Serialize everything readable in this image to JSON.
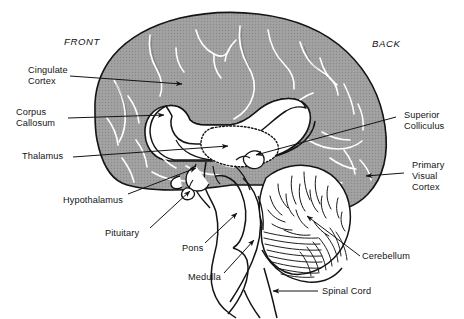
{
  "figure": {
    "background_color": "#ffffff",
    "ink_color": "#141414",
    "cortex_fill_color": "#9a9a9a",
    "sulcus_line_color": "#ffffff",
    "interior_fill_color": "#ffffff"
  },
  "orientation": {
    "front": "FRONT",
    "back": "BACK"
  },
  "labels": {
    "cingulate_cortex": "Cingulate\nCortex",
    "corpus_callosum": "Corpus\nCallosum",
    "thalamus": "Thalamus",
    "hypothalamus": "Hypothalamus",
    "pituitary": "Pituitary",
    "pons": "Pons",
    "medulla": "Medulla",
    "superior_colliculus": "Superior\nColliculus",
    "primary_visual_cortex": "Primary\nVisual\nCortex",
    "cerebellum": "Cerebellum",
    "spinal_cord": "Spinal Cord"
  },
  "structures": [
    {
      "name": "cingulate-cortex",
      "side": "left"
    },
    {
      "name": "corpus-callosum",
      "side": "left"
    },
    {
      "name": "thalamus",
      "side": "left"
    },
    {
      "name": "hypothalamus",
      "side": "left"
    },
    {
      "name": "pituitary",
      "side": "left"
    },
    {
      "name": "pons",
      "side": "left"
    },
    {
      "name": "medulla",
      "side": "left"
    },
    {
      "name": "superior-colliculus",
      "side": "right"
    },
    {
      "name": "primary-visual-cortex",
      "side": "right"
    },
    {
      "name": "cerebellum",
      "side": "right"
    },
    {
      "name": "spinal-cord",
      "side": "right"
    }
  ]
}
